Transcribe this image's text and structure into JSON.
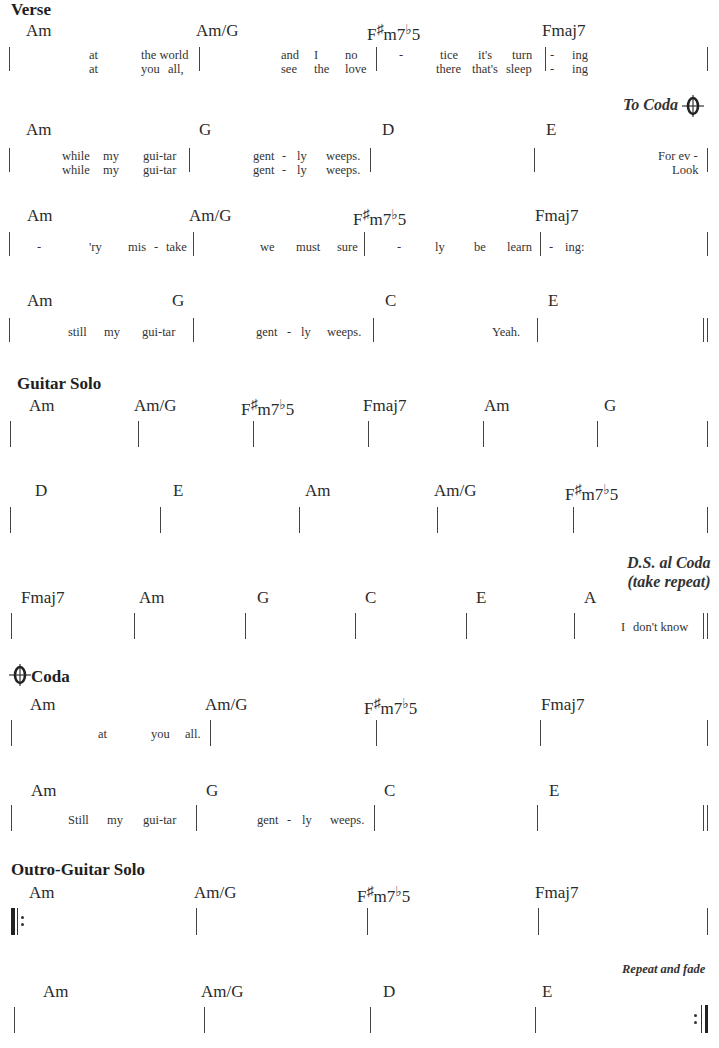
{
  "sections": {
    "verse": {
      "title": "Verse"
    },
    "guitar_solo": {
      "title": "Guitar Solo"
    },
    "coda": {
      "title": "Coda"
    },
    "outro": {
      "title": "Outro-Guitar Solo"
    }
  },
  "markings": {
    "to_coda": "To Coda",
    "ds_al_coda_line1": "D.S. al Coda",
    "ds_al_coda_line2": "(take repeat)",
    "repeat_and_fade": "Repeat and fade"
  },
  "chords": {
    "am": "Am",
    "am_g": "Am/G",
    "fsharp_root": "F",
    "sharp": "♯",
    "m7": "m7",
    "flat": "♭",
    "five": "5",
    "fmaj7": "Fmaj7",
    "g": "G",
    "d": "D",
    "e": "E",
    "c": "C",
    "a": "A"
  },
  "rows": {
    "r1": {
      "l1": [
        "at",
        "the world",
        "and",
        "I",
        "no",
        "-",
        "tice",
        "it's",
        "turn",
        "-",
        "ing"
      ],
      "l2": [
        "at",
        "you",
        "all,",
        "see",
        "the",
        "love",
        "there",
        "that's",
        "sleep",
        "-",
        "ing"
      ]
    },
    "r2": {
      "l1": [
        "while",
        "my",
        "gui-tar",
        "gent",
        "-",
        "ly",
        "weeps.",
        "For ev -"
      ],
      "l2": [
        "while",
        "my",
        "gui-tar",
        "gent",
        "-",
        "ly",
        "weeps.",
        "Look"
      ]
    },
    "r3": {
      "l1": [
        "-",
        "'ry",
        "mis",
        "-",
        "take",
        "we",
        "must",
        "sure",
        "-",
        "ly",
        "be",
        "learn",
        "-",
        "ing:"
      ]
    },
    "r4": {
      "l1": [
        "still",
        "my",
        "gui-tar",
        "gent",
        "-",
        "ly",
        "weeps.",
        "Yeah."
      ]
    },
    "r7": {
      "l1": [
        "I",
        "don't know"
      ]
    },
    "r8": {
      "l1": [
        "at",
        "you",
        "all."
      ]
    },
    "r9": {
      "l1": [
        "Still",
        "my",
        "gui-tar",
        "gent",
        "-",
        "ly",
        "weeps."
      ]
    }
  }
}
